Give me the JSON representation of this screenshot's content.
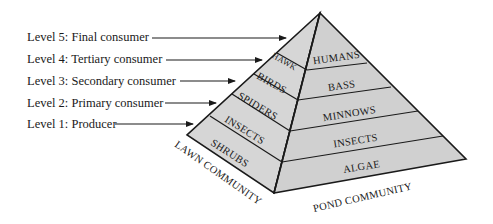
{
  "levels": [
    {
      "label": "Level 5: Final consumer",
      "y": 31
    },
    {
      "label": "Level 4: Tertiary consumer",
      "y": 53
    },
    {
      "label": "Level 3: Secondary consumer",
      "y": 74
    },
    {
      "label": "Level 2: Primary consumer",
      "y": 96
    },
    {
      "label": "Level 1: Producer",
      "y": 117
    }
  ],
  "lawn_community": {
    "title": "LAWN COMMUNITY",
    "bands": [
      "HAWK",
      "BIRDS",
      "SPIDERS",
      "INSECTS",
      "SHRUBS"
    ]
  },
  "pond_community": {
    "title": "POND COMMUNITY",
    "bands": [
      "HUMANS",
      "BASS",
      "MINNOWS",
      "INSECTS",
      "ALGAE"
    ]
  },
  "colors": {
    "face_fill": "#d4d4d4",
    "outline": "#1a1a1a",
    "text": "#1a1a1a"
  }
}
